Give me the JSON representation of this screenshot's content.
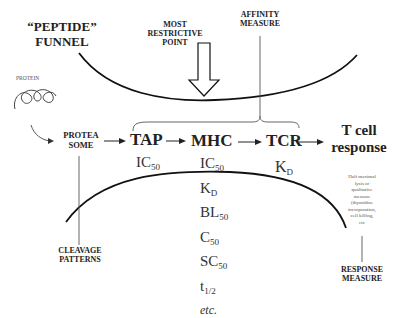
{
  "title": {
    "line1": "“PEPTIDE”",
    "line2": "FUNNEL"
  },
  "restrictive": {
    "line1": "MOST",
    "line2": "RESTRICTIVE",
    "line3": "POINT"
  },
  "affinity": {
    "line1": "AFFINITY",
    "line2": "MEASURE"
  },
  "protein_label": "PROTEIN",
  "pathway": {
    "proteasome_line1": "PROTEA",
    "proteasome_line2": "SOME",
    "tap": "TAP",
    "mhc": "MHC",
    "tcr": "TCR",
    "tcell_line1": "T cell",
    "tcell_line2": "response"
  },
  "measures": {
    "tap": [
      {
        "base": "IC",
        "sub": "50"
      }
    ],
    "mhc": [
      {
        "base": "IC",
        "sub": "50"
      },
      {
        "base": "K",
        "sub": "D"
      },
      {
        "base": "BL",
        "sub": "50"
      },
      {
        "base": "C",
        "sub": "50"
      },
      {
        "base": "SC",
        "sub": "50"
      },
      {
        "base": "t",
        "sub": "1/2"
      },
      {
        "base": "etc.",
        "sub": ""
      }
    ],
    "tcr": [
      {
        "base": "K",
        "sub": "D"
      }
    ]
  },
  "response_note": {
    "l1": "Half maximal",
    "l2": "lysis or",
    "l3": "qualitative",
    "l4": "measure",
    "l5": "(thymidine",
    "l6": "incorporation,",
    "l7": "cell killing,",
    "l8": "etc"
  },
  "cleavage": {
    "line1": "CLEAVAGE",
    "line2": "PATTERNS"
  },
  "response_measure": {
    "line1": "RESPONSE",
    "line2": "MEASURE"
  }
}
